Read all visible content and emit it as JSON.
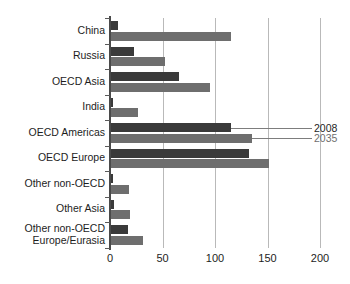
{
  "chart_data": {
    "type": "bar",
    "orientation": "horizontal",
    "title": "",
    "subtitle": "",
    "xlabel": "",
    "ylabel": "",
    "xlim": [
      0,
      200
    ],
    "ylim": null,
    "grid": true,
    "gridlines_axis": "x",
    "legend_position": "callout-right",
    "xticks": [
      0,
      50,
      100,
      150,
      200
    ],
    "xtick_labels": [
      "0",
      "50",
      "100",
      "150",
      "200"
    ],
    "categories": [
      "China",
      "Russia",
      "OECD Asia",
      "India",
      "OECD Americas",
      "OECD Europe",
      "Other non-OECD",
      "Other Asia",
      "Other non-OECD Europe/Eurasia"
    ],
    "category_lines": [
      [
        "China"
      ],
      [
        "Russia"
      ],
      [
        "OECD Asia"
      ],
      [
        "India"
      ],
      [
        "OECD Americas"
      ],
      [
        "OECD Europe"
      ],
      [
        "Other non-OECD"
      ],
      [
        "Other Asia"
      ],
      [
        "Other non-OECD",
        "Europe/Eurasia"
      ]
    ],
    "series": [
      {
        "name": "2008",
        "color": "#3a3a3a",
        "values": [
          8,
          23,
          66,
          3,
          115,
          132,
          3,
          4,
          17
        ]
      },
      {
        "name": "2035",
        "color": "#6e6e6e",
        "values": [
          115,
          52,
          95,
          27,
          135,
          151,
          18,
          19,
          31
        ]
      }
    ],
    "annotations": [
      {
        "text": "2008",
        "series": "2008",
        "points_to_category": "OECD Americas"
      },
      {
        "text": "2035",
        "series": "2035",
        "points_to_category": "OECD Americas"
      }
    ]
  },
  "legend": {
    "items": [
      {
        "label": "2008",
        "color": "#3a3a3a"
      },
      {
        "label": "2035",
        "color": "#6e6e6e"
      }
    ]
  },
  "colors": {
    "background": "#ffffff",
    "axis": "#4a4a4a",
    "gridline": "#b9b9b9",
    "series_2008": "#3a3a3a",
    "series_2035": "#6e6e6e",
    "text": "#1d1d1d"
  }
}
